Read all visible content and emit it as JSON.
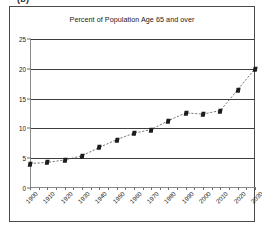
{
  "panel": {
    "label": "(b)"
  },
  "chart_data": {
    "type": "line",
    "title": "Percent of Population Age 65 and over",
    "xlabel": "",
    "ylabel": "",
    "x": [
      1900,
      1910,
      1920,
      1930,
      1940,
      1950,
      1960,
      1970,
      1980,
      1990,
      2000,
      2010,
      2020,
      2030
    ],
    "values": [
      4.1,
      4.3,
      4.7,
      5.4,
      6.8,
      8.1,
      9.2,
      9.8,
      11.3,
      12.6,
      12.4,
      13.0,
      16.5,
      20.0
    ],
    "series": [
      {
        "name": "Percent of Population Age 65 and over",
        "values": [
          4.1,
          4.3,
          4.7,
          5.4,
          6.8,
          8.1,
          9.2,
          9.8,
          11.3,
          12.6,
          12.4,
          13.0,
          16.5,
          20.0
        ]
      }
    ],
    "xlim": [
      1900,
      2030
    ],
    "ylim": [
      0,
      25
    ],
    "ytick_labels": [
      "0",
      "5",
      "10",
      "15",
      "20",
      "25"
    ],
    "ytick_values": [
      0,
      5,
      10,
      15,
      20,
      25
    ],
    "xtick_labels": [
      "1900",
      "1910",
      "1920",
      "1930",
      "1940",
      "1950",
      "1960",
      "1970",
      "1980",
      "1990",
      "2000",
      "2010",
      "2020",
      "2030"
    ],
    "xtick_values": [
      1900,
      1910,
      1920,
      1930,
      1940,
      1950,
      1960,
      1970,
      1980,
      1990,
      2000,
      2010,
      2020,
      2030
    ],
    "minor_xtick_values": [
      1905,
      1915,
      1925,
      1935,
      1945,
      1955,
      1965,
      1975,
      1985,
      1995,
      2005,
      2015,
      2025
    ],
    "grid": "horizontal",
    "legend": "none",
    "line_style": "dashed",
    "marker_style": "square",
    "line_color": "#555555",
    "marker_color": "#1c1c1c",
    "grid_color": "#3d3d3d",
    "background_color": "#ffffff"
  }
}
